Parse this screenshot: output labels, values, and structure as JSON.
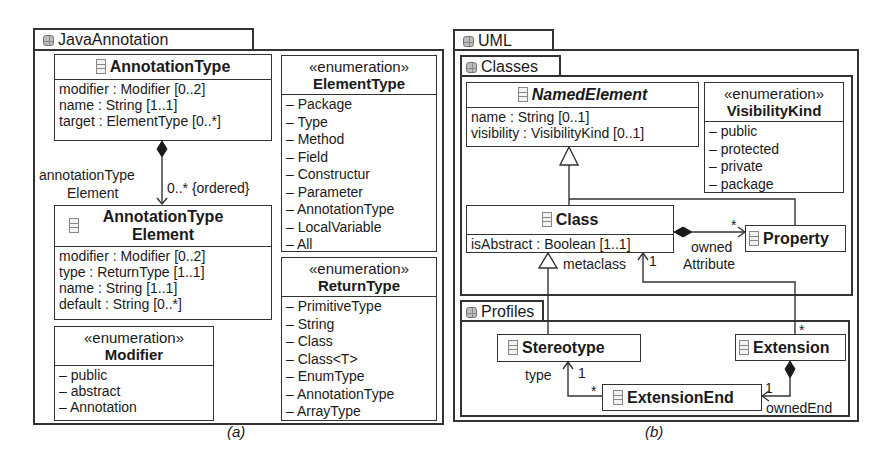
{
  "panel_a": {
    "caption": "(a)",
    "package": {
      "name": "JavaAnnotation",
      "icon": "package-icon"
    },
    "annotation_type": {
      "name": "AnnotationType",
      "icon": "class-icon",
      "attributes": [
        "modifier : Modifier [0..2]",
        "name : String [1..1]",
        "target : ElementType [0..*]"
      ]
    },
    "annotation_type_element": {
      "name_line1": "AnnotationType",
      "name_line2": "Element",
      "icon": "class-icon",
      "attributes": [
        "modifier : Modifier [0..2]",
        "type : ReturnType [1..1]",
        "name : String [1..1]",
        "default : String [0..*]"
      ]
    },
    "composition": {
      "role_line1": "annotationType",
      "role_line2": "Element",
      "multiplicity": "0..* {ordered}"
    },
    "modifier_enum": {
      "stereotype": "«enumeration»",
      "name": "Modifier",
      "literals": [
        "– public",
        "– abstract",
        "– Annotation"
      ]
    },
    "element_type_enum": {
      "stereotype": "«enumeration»",
      "name": "ElementType",
      "literals": [
        "– Package",
        "– Type",
        "– Method",
        "– Field",
        "– Constructur",
        "– Parameter",
        "– AnnotationType",
        "– LocalVariable",
        "– All"
      ]
    },
    "return_type_enum": {
      "stereotype": "«enumeration»",
      "name": "ReturnType",
      "literals": [
        "– PrimitiveType",
        "– String",
        "– Class",
        "– Class<T>",
        "– EnumType",
        "– AnnotationType",
        "– ArrayType"
      ]
    }
  },
  "panel_b": {
    "caption": "(b)",
    "package": {
      "name": "UML",
      "icon": "package-icon"
    },
    "classes_package": {
      "name": "Classes",
      "icon": "package-icon"
    },
    "profiles_package": {
      "name": "Profiles",
      "icon": "package-icon"
    },
    "named_element": {
      "name": "NamedElement",
      "abstract": true,
      "icon": "class-icon",
      "attributes": [
        "name : String [0..1]",
        "visibility : VisibilityKind [0..1]"
      ]
    },
    "visibility_kind_enum": {
      "stereotype": "«enumeration»",
      "name": "VisibilityKind",
      "literals": [
        "– public",
        "– protected",
        "– private",
        "– package"
      ]
    },
    "class": {
      "name": "Class",
      "icon": "class-icon",
      "attributes": [
        "isAbstract : Boolean [1..1]"
      ]
    },
    "property": {
      "name": "Property",
      "icon": "class-icon"
    },
    "stereotype": {
      "name": "Stereotype",
      "icon": "class-icon"
    },
    "extension": {
      "name": "Extension",
      "icon": "class-icon"
    },
    "extension_end": {
      "name": "ExtensionEnd",
      "icon": "class-icon"
    },
    "labels": {
      "owned_attribute_mult": "*",
      "owned_attribute_line1": "owned",
      "owned_attribute_line2": "Attribute",
      "metaclass": "metaclass",
      "metaclass_mult": "1",
      "extension_mult": "*",
      "type": "type",
      "type_mult": "1",
      "extension_end_mult": "*",
      "owned_end": "ownedEnd",
      "owned_end_mult": "1"
    }
  },
  "colors": {
    "line": "#333333",
    "icon": "#888888",
    "background": "#ffffff"
  }
}
